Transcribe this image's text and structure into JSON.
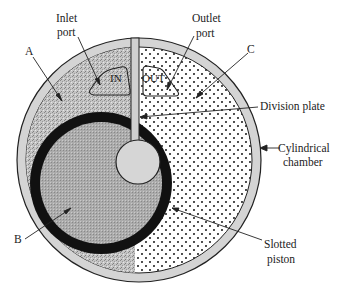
{
  "diagram": {
    "labels": {
      "inlet_port_line1": "Inlet",
      "inlet_port_line2": "port",
      "outlet_port_line1": "Outlet",
      "outlet_port_line2": "port",
      "region_a": "A",
      "region_b": "B",
      "region_c": "C",
      "division_plate": "Division plate",
      "cylindrical_chamber_line1": "Cylindrical",
      "cylindrical_chamber_line2": "chamber",
      "slotted_piston_line1": "Slotted",
      "slotted_piston_line2": "piston",
      "port_in": "IN",
      "port_out": "OUT"
    },
    "colors": {
      "chamber_wall": "#d4d4d4",
      "region_a_fill": "#bdbdbd",
      "region_b_fill": "#a9a9a9",
      "region_c_fill": "#ffffff",
      "piston_ring": "#111111",
      "hub_fill": "#d6d6d6",
      "stroke": "#222222"
    }
  }
}
